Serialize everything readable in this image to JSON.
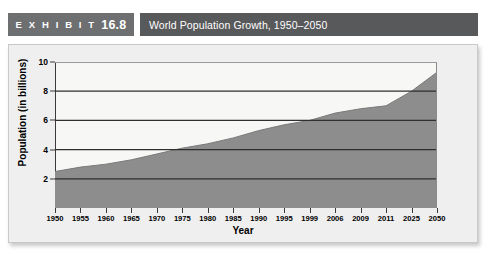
{
  "header": {
    "exhibit_label": "E X H I B I T",
    "exhibit_number": "16.8",
    "title": "World Population Growth, 1950–2050"
  },
  "colors": {
    "exhibit_block": "#6e6f71",
    "title_block": "#58595b",
    "panel_background": "#efefef",
    "plot_background": "#f7f7f5",
    "area_fill": "#8d8d8d",
    "axis": "#3a3a3a",
    "gridline": "#2f2f2f"
  },
  "chart_data": {
    "type": "area",
    "title": "World Population Growth, 1950–2050",
    "xlabel": "Year",
    "ylabel": "Population (in billions)",
    "categories": [
      "1950",
      "1955",
      "1960",
      "1965",
      "1970",
      "1975",
      "1980",
      "1985",
      "1990",
      "1995",
      "1999",
      "2006",
      "2009",
      "2011",
      "2025",
      "2050"
    ],
    "values": [
      2.5,
      2.8,
      3.0,
      3.3,
      3.7,
      4.1,
      4.4,
      4.8,
      5.3,
      5.7,
      6.0,
      6.5,
      6.8,
      7.0,
      8.0,
      9.3
    ],
    "ylim": [
      0,
      10
    ],
    "yticks": [
      2,
      4,
      6,
      8,
      10
    ],
    "grid": true,
    "legend": "none",
    "series": [
      {
        "name": "World population",
        "values": [
          2.5,
          2.8,
          3.0,
          3.3,
          3.7,
          4.1,
          4.4,
          4.8,
          5.3,
          5.7,
          6.0,
          6.5,
          6.8,
          7.0,
          8.0,
          9.3
        ]
      }
    ]
  }
}
